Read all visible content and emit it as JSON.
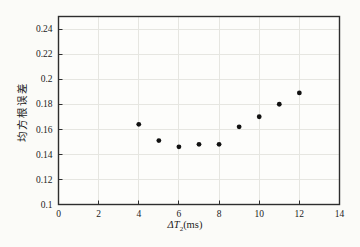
{
  "figure": {
    "background": "#fbfbf8"
  },
  "chart_data": {
    "type": "scatter",
    "title": "",
    "xlabel": "ΔT₂(ms)",
    "xlabel_parts": {
      "variable": "ΔT",
      "subscript": "2",
      "unit": "(ms)"
    },
    "ylabel": "均方根误差",
    "x": [
      4,
      5,
      6,
      7,
      8,
      9,
      10,
      11,
      12
    ],
    "y": [
      0.164,
      0.151,
      0.146,
      0.148,
      0.148,
      0.162,
      0.17,
      0.18,
      0.189
    ],
    "xlim": [
      0,
      14
    ],
    "ylim": [
      0.1,
      0.25
    ],
    "x_ticks": [
      0,
      2,
      4,
      6,
      8,
      10,
      12,
      14
    ],
    "x_tick_labels": [
      "0",
      "2",
      "4",
      "6",
      "8",
      "10",
      "12",
      "14"
    ],
    "y_ticks": [
      0.1,
      0.12,
      0.14,
      0.16,
      0.18,
      0.2,
      0.22,
      0.24
    ],
    "y_tick_labels": [
      "0.1",
      "0.12",
      "0.14",
      "0.16",
      "0.18",
      "0.2",
      "0.22",
      "0.24"
    ],
    "grid": true,
    "marker": {
      "shape": "circle",
      "color": "#121212",
      "radius_px": 2.4
    },
    "colors": {
      "grid": "#e6e6e1",
      "axis": "#2e2e2e",
      "text": "#1c1c1c",
      "plot_background": "#fdfdfb"
    }
  }
}
